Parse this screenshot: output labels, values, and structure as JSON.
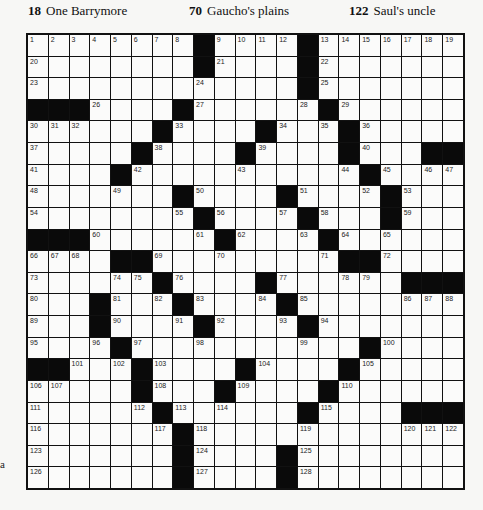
{
  "clues_visible": [
    {
      "number": "18",
      "text": "One Barrymore",
      "x": 28
    },
    {
      "number": "70",
      "text": "Gaucho's plains",
      "x": 189
    },
    {
      "number": "122",
      "text": "Saul's uncle",
      "x": 349
    }
  ],
  "margin_mark": "a",
  "grid": {
    "rows": 21,
    "cols": 21,
    "black": [
      [
        0,
        8
      ],
      [
        0,
        13
      ],
      [
        1,
        8
      ],
      [
        1,
        13
      ],
      [
        2,
        13
      ],
      [
        3,
        0
      ],
      [
        3,
        1
      ],
      [
        3,
        2
      ],
      [
        3,
        7
      ],
      [
        3,
        14
      ],
      [
        4,
        6
      ],
      [
        4,
        11
      ],
      [
        4,
        15
      ],
      [
        5,
        5
      ],
      [
        5,
        10
      ],
      [
        5,
        15
      ],
      [
        5,
        19
      ],
      [
        5,
        20
      ],
      [
        6,
        4
      ],
      [
        6,
        16
      ],
      [
        7,
        7
      ],
      [
        7,
        12
      ],
      [
        7,
        17
      ],
      [
        8,
        8
      ],
      [
        8,
        13
      ],
      [
        8,
        17
      ],
      [
        9,
        0
      ],
      [
        9,
        1
      ],
      [
        9,
        2
      ],
      [
        9,
        9
      ],
      [
        9,
        14
      ],
      [
        10,
        4
      ],
      [
        10,
        5
      ],
      [
        10,
        15
      ],
      [
        10,
        16
      ],
      [
        11,
        6
      ],
      [
        11,
        11
      ],
      [
        11,
        18
      ],
      [
        11,
        19
      ],
      [
        11,
        20
      ],
      [
        12,
        3
      ],
      [
        12,
        7
      ],
      [
        12,
        12
      ],
      [
        13,
        3
      ],
      [
        13,
        8
      ],
      [
        13,
        13
      ],
      [
        14,
        4
      ],
      [
        14,
        16
      ],
      [
        15,
        0
      ],
      [
        15,
        1
      ],
      [
        15,
        5
      ],
      [
        15,
        10
      ],
      [
        15,
        15
      ],
      [
        16,
        5
      ],
      [
        16,
        9
      ],
      [
        16,
        14
      ],
      [
        17,
        6
      ],
      [
        17,
        13
      ],
      [
        17,
        18
      ],
      [
        17,
        19
      ],
      [
        17,
        20
      ],
      [
        18,
        7
      ],
      [
        19,
        7
      ],
      [
        19,
        12
      ],
      [
        20,
        7
      ],
      [
        20,
        12
      ]
    ],
    "numbers": [
      [
        0,
        0,
        1
      ],
      [
        0,
        1,
        2
      ],
      [
        0,
        2,
        3
      ],
      [
        0,
        3,
        4
      ],
      [
        0,
        4,
        5
      ],
      [
        0,
        5,
        6
      ],
      [
        0,
        6,
        7
      ],
      [
        0,
        7,
        8
      ],
      [
        0,
        9,
        9
      ],
      [
        0,
        10,
        10
      ],
      [
        0,
        11,
        11
      ],
      [
        0,
        12,
        12
      ],
      [
        0,
        14,
        13
      ],
      [
        0,
        15,
        14
      ],
      [
        0,
        16,
        15
      ],
      [
        0,
        17,
        16
      ],
      [
        0,
        18,
        17
      ],
      [
        0,
        19,
        18
      ],
      [
        0,
        20,
        19
      ],
      [
        1,
        0,
        20
      ],
      [
        1,
        9,
        21
      ],
      [
        1,
        14,
        22
      ],
      [
        2,
        0,
        23
      ],
      [
        2,
        8,
        24
      ],
      [
        2,
        14,
        25
      ],
      [
        3,
        3,
        26
      ],
      [
        3,
        8,
        27
      ],
      [
        3,
        13,
        28
      ],
      [
        3,
        15,
        29
      ],
      [
        4,
        0,
        30
      ],
      [
        4,
        1,
        31
      ],
      [
        4,
        2,
        32
      ],
      [
        4,
        7,
        33
      ],
      [
        4,
        12,
        34
      ],
      [
        4,
        14,
        35
      ],
      [
        4,
        16,
        36
      ],
      [
        5,
        0,
        37
      ],
      [
        5,
        6,
        38
      ],
      [
        5,
        11,
        39
      ],
      [
        5,
        16,
        40
      ],
      [
        6,
        0,
        41
      ],
      [
        6,
        5,
        42
      ],
      [
        6,
        10,
        43
      ],
      [
        6,
        15,
        44
      ],
      [
        6,
        17,
        45
      ],
      [
        6,
        19,
        46
      ],
      [
        6,
        20,
        47
      ],
      [
        7,
        0,
        48
      ],
      [
        7,
        4,
        49
      ],
      [
        7,
        8,
        50
      ],
      [
        7,
        13,
        51
      ],
      [
        7,
        16,
        52
      ],
      [
        7,
        18,
        53
      ],
      [
        8,
        0,
        54
      ],
      [
        8,
        7,
        55
      ],
      [
        8,
        9,
        56
      ],
      [
        8,
        12,
        57
      ],
      [
        8,
        14,
        58
      ],
      [
        8,
        18,
        59
      ],
      [
        9,
        3,
        60
      ],
      [
        9,
        8,
        61
      ],
      [
        9,
        10,
        62
      ],
      [
        9,
        13,
        63
      ],
      [
        9,
        15,
        64
      ],
      [
        9,
        17,
        65
      ],
      [
        10,
        0,
        66
      ],
      [
        10,
        1,
        67
      ],
      [
        10,
        2,
        68
      ],
      [
        10,
        6,
        69
      ],
      [
        10,
        9,
        70
      ],
      [
        10,
        14,
        71
      ],
      [
        10,
        17,
        72
      ],
      [
        11,
        0,
        73
      ],
      [
        11,
        4,
        74
      ],
      [
        11,
        5,
        75
      ],
      [
        11,
        7,
        76
      ],
      [
        11,
        12,
        77
      ],
      [
        11,
        15,
        78
      ],
      [
        11,
        16,
        79
      ],
      [
        12,
        0,
        80
      ],
      [
        12,
        4,
        81
      ],
      [
        12,
        6,
        82
      ],
      [
        12,
        8,
        83
      ],
      [
        12,
        11,
        84
      ],
      [
        12,
        13,
        85
      ],
      [
        12,
        18,
        86
      ],
      [
        12,
        19,
        87
      ],
      [
        12,
        20,
        88
      ],
      [
        13,
        0,
        89
      ],
      [
        13,
        4,
        90
      ],
      [
        13,
        7,
        91
      ],
      [
        13,
        9,
        92
      ],
      [
        13,
        12,
        93
      ],
      [
        13,
        14,
        94
      ],
      [
        14,
        0,
        95
      ],
      [
        14,
        3,
        96
      ],
      [
        14,
        5,
        97
      ],
      [
        14,
        8,
        98
      ],
      [
        14,
        13,
        99
      ],
      [
        14,
        17,
        100
      ],
      [
        15,
        2,
        101
      ],
      [
        15,
        4,
        102
      ],
      [
        15,
        6,
        103
      ],
      [
        15,
        11,
        104
      ],
      [
        15,
        16,
        105
      ],
      [
        16,
        0,
        106
      ],
      [
        16,
        1,
        107
      ],
      [
        16,
        6,
        108
      ],
      [
        16,
        10,
        109
      ],
      [
        16,
        15,
        110
      ],
      [
        17,
        0,
        111
      ],
      [
        17,
        5,
        112
      ],
      [
        17,
        7,
        113
      ],
      [
        17,
        9,
        114
      ],
      [
        17,
        14,
        115
      ],
      [
        18,
        0,
        116
      ],
      [
        18,
        6,
        117
      ],
      [
        18,
        8,
        118
      ],
      [
        18,
        13,
        119
      ],
      [
        18,
        18,
        120
      ],
      [
        18,
        19,
        121
      ],
      [
        18,
        20,
        122
      ],
      [
        19,
        0,
        123
      ],
      [
        19,
        8,
        124
      ],
      [
        19,
        13,
        125
      ],
      [
        20,
        0,
        126
      ],
      [
        20,
        8,
        127
      ],
      [
        20,
        13,
        128
      ]
    ]
  }
}
